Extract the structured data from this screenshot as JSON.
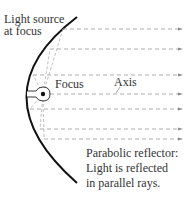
{
  "labels": {
    "source_line1": "Light source",
    "source_line2": "at focus",
    "focus": "Focus",
    "axis": "Axis",
    "caption_line1": "Parabolic reflector:",
    "caption_line2": "Light is reflected",
    "caption_line3": "in parallel rays."
  },
  "colors": {
    "reflector": "#111111",
    "rays": "#9a9a9a",
    "text": "#333333",
    "bulb": "#222222"
  },
  "geometry": {
    "vertex": [
      26,
      94
    ],
    "focus": [
      43,
      94
    ],
    "ray_y": [
      29,
      49,
      75,
      94,
      109,
      129,
      139
    ],
    "ray_end_x": 182
  }
}
